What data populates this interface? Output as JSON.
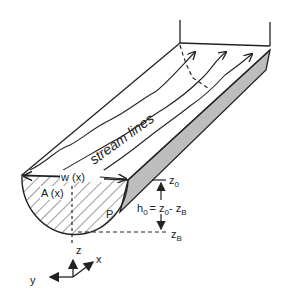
{
  "diagram": {
    "labels": {
      "stream_lines": "stream lines",
      "width": "w (x)",
      "area": "A (x)",
      "perimeter": "P",
      "z0": "z",
      "z0_sub": "0",
      "zB": "z",
      "zB_sub": "B",
      "h0": "h",
      "h0_sub": "0",
      "h0_eq": "= z",
      "h0_eq_sub0": "0",
      "h0_minus": "- z",
      "h0_minus_subB": "B",
      "axis_z": "z",
      "axis_x": "x",
      "axis_y": "y"
    },
    "colors": {
      "line": "#222222",
      "side_fill": "#bdbdbd"
    }
  }
}
